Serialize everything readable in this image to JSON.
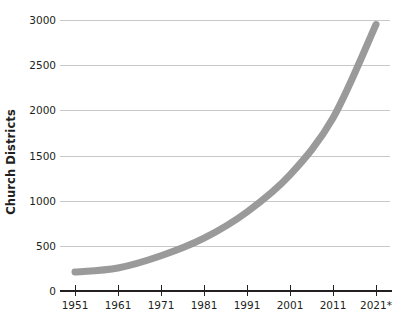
{
  "chart_data": {
    "type": "line",
    "title": "",
    "xlabel": "",
    "ylabel": "Church Districts",
    "categories": [
      "1951",
      "1961",
      "1971",
      "1981",
      "1991",
      "2001",
      "2011",
      "2021*"
    ],
    "x": [
      1951,
      1961,
      1971,
      1981,
      1991,
      2001,
      2011,
      2021
    ],
    "values": [
      210,
      255,
      390,
      585,
      875,
      1285,
      1915,
      2950
    ],
    "series": [
      {
        "name": "Church Districts",
        "values": [
          210,
          255,
          390,
          585,
          875,
          1285,
          1915,
          2950
        ]
      }
    ],
    "ylim": [
      0,
      3000
    ],
    "yticks": [
      0,
      500,
      1000,
      1500,
      2000,
      2500,
      3000
    ],
    "ytick_labels": [
      "0",
      "500",
      "1000",
      "1500",
      "2000",
      "2500",
      "3000"
    ],
    "xticks": [
      1951,
      1961,
      1971,
      1981,
      1991,
      2001,
      2011,
      2021
    ],
    "xtick_labels": [
      "1951",
      "1961",
      "1971",
      "1981",
      "1991",
      "2001",
      "2011",
      "2021*"
    ],
    "grid": "horizontal",
    "legend": "none",
    "annotations": [
      "*"
    ],
    "colors": {
      "line": "#9a9a9a",
      "grid": "#c8c8c8",
      "axis": "#231f20",
      "text": "#231f20",
      "background": "#ffffff"
    },
    "line_width": 7
  }
}
